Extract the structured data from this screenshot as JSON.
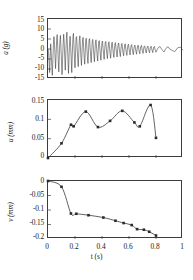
{
  "figure": {
    "name": "seismic-response-three-panel",
    "background": "#ffffff",
    "line_color": "#333333",
    "marker_color": "#2b2b2b",
    "axis_color": "#3c3c3c"
  },
  "chart_data": [
    {
      "type": "line",
      "panel": "top",
      "name": "acceleration-time-history",
      "title": "",
      "xlabel": "",
      "ylabel": "a (g)",
      "ylabel_symbol": "a",
      "ylabel_unit": "(g)",
      "xlim": [
        0,
        1
      ],
      "ylim": [
        -15,
        15
      ],
      "yticks": [
        15,
        10,
        5,
        0,
        -5,
        -10,
        -15
      ],
      "ytick_labels": [
        "15",
        "10",
        "5",
        "0",
        "-5",
        "-10",
        "-15"
      ],
      "xticks": [
        0,
        0.2,
        0.4,
        0.6,
        0.8,
        1
      ],
      "xtick_labels": [],
      "grid": false,
      "legend": false,
      "x": [
        0.0,
        0.004,
        0.008,
        0.012,
        0.016,
        0.02,
        0.024,
        0.028,
        0.032,
        0.036,
        0.04,
        0.044,
        0.048,
        0.052,
        0.056,
        0.06,
        0.064,
        0.068,
        0.072,
        0.076,
        0.08,
        0.084,
        0.088,
        0.092,
        0.096,
        0.1,
        0.104,
        0.108,
        0.112,
        0.116,
        0.12,
        0.124,
        0.128,
        0.132,
        0.136,
        0.14,
        0.144,
        0.148,
        0.152,
        0.156,
        0.16,
        0.164,
        0.168,
        0.172,
        0.176,
        0.18,
        0.184,
        0.188,
        0.192,
        0.196,
        0.2,
        0.204,
        0.208,
        0.212,
        0.216,
        0.22,
        0.224,
        0.228,
        0.232,
        0.236,
        0.24,
        0.244,
        0.248,
        0.252,
        0.256,
        0.26,
        0.264,
        0.268,
        0.272,
        0.276,
        0.28,
        0.284,
        0.288,
        0.292,
        0.296,
        0.3,
        0.304,
        0.308,
        0.312,
        0.316,
        0.32,
        0.324,
        0.328,
        0.332,
        0.336,
        0.34,
        0.344,
        0.348,
        0.352,
        0.356,
        0.36,
        0.364,
        0.368,
        0.372,
        0.376,
        0.38,
        0.384,
        0.388,
        0.392,
        0.396,
        0.4,
        0.404,
        0.408,
        0.412,
        0.416,
        0.42,
        0.424,
        0.428,
        0.432,
        0.436,
        0.44,
        0.444,
        0.448,
        0.452,
        0.456,
        0.46,
        0.464,
        0.468,
        0.472,
        0.476,
        0.48,
        0.484,
        0.488,
        0.492,
        0.496,
        0.5,
        0.504,
        0.508,
        0.512,
        0.516,
        0.52,
        0.524,
        0.528,
        0.532,
        0.536,
        0.54,
        0.544,
        0.548,
        0.552,
        0.556,
        0.56,
        0.564,
        0.568,
        0.572,
        0.576,
        0.58,
        0.584,
        0.588,
        0.592,
        0.596,
        0.6,
        0.604,
        0.608,
        0.612,
        0.616,
        0.62,
        0.624,
        0.628,
        0.632,
        0.636,
        0.64,
        0.644,
        0.648,
        0.652,
        0.656,
        0.66,
        0.664,
        0.668,
        0.672,
        0.676,
        0.68,
        0.684,
        0.688,
        0.692,
        0.696,
        0.7,
        0.704,
        0.708,
        0.712,
        0.716,
        0.72,
        0.724,
        0.728,
        0.732,
        0.736,
        0.74,
        0.744,
        0.748,
        0.752,
        0.756,
        0.76,
        0.764,
        0.768,
        0.772,
        0.776,
        0.78,
        0.784,
        0.788,
        0.792,
        0.796,
        0.8,
        0.81,
        0.82,
        0.83,
        0.84,
        0.85,
        0.86,
        0.87,
        0.88,
        0.89,
        0.9,
        0.92,
        0.94,
        0.96,
        0.98,
        1.0
      ],
      "values": [
        0.0,
        -1.8,
        -6.4,
        -11.8,
        -4.2,
        2.6,
        -2.2,
        -8.6,
        -13.2,
        -5.4,
        1.8,
        6.2,
        2.4,
        -3.6,
        -9.8,
        -2.8,
        4.4,
        7.2,
        1.2,
        -5.8,
        -11.4,
        -3.2,
        3.8,
        6.8,
        0.4,
        -6.2,
        -12.8,
        -4.8,
        2.2,
        7.4,
        3.2,
        -4.2,
        -10.6,
        -2.4,
        5.2,
        8.4,
        1.6,
        -5.4,
        -12.2,
        -3.8,
        3.4,
        6.4,
        0.8,
        -5.2,
        -11.8,
        -2.6,
        4.8,
        7.8,
        2.2,
        -4.6,
        -9.4,
        -1.8,
        5.6,
        6.2,
        0.6,
        -4.8,
        -8.8,
        -2.2,
        4.2,
        6.6,
        1.4,
        -4.4,
        -8.2,
        -1.6,
        4.6,
        5.8,
        0.8,
        -4.2,
        -7.6,
        -1.4,
        4.8,
        5.4,
        0.4,
        -3.8,
        -7.2,
        -1.2,
        4.4,
        5.2,
        0.6,
        -3.6,
        -6.8,
        -1.0,
        4.2,
        4.8,
        0.4,
        -3.4,
        -6.4,
        -0.8,
        3.8,
        4.6,
        0.2,
        -3.2,
        -6.0,
        -0.6,
        3.6,
        4.2,
        0.4,
        -3.0,
        -5.6,
        -0.6,
        3.4,
        4.0,
        0.2,
        -2.8,
        -5.2,
        -0.4,
        3.2,
        3.8,
        0.2,
        -2.6,
        -4.8,
        -0.4,
        3.0,
        3.6,
        0.2,
        -2.4,
        -4.6,
        -0.4,
        2.8,
        3.4,
        0.2,
        -2.2,
        -4.2,
        -0.2,
        2.6,
        3.2,
        0.2,
        -2.2,
        -4.0,
        -0.2,
        2.4,
        3.0,
        0.1,
        -2.0,
        -3.8,
        -0.2,
        2.2,
        2.8,
        0.1,
        -1.8,
        -3.4,
        -0.2,
        2.0,
        2.6,
        0.1,
        -1.8,
        -3.2,
        -0.2,
        1.9,
        2.4,
        0.1,
        -1.6,
        -3.0,
        -0.1,
        1.8,
        2.2,
        0.1,
        -1.5,
        -2.8,
        -0.1,
        1.6,
        2.0,
        0.1,
        -1.4,
        -2.6,
        -0.1,
        1.5,
        1.9,
        0.1,
        -1.3,
        -2.4,
        -0.1,
        1.4,
        1.8,
        0.1,
        -1.2,
        -2.2,
        -0.1,
        1.3,
        1.6,
        0.1,
        -1.1,
        -2.0,
        -0.1,
        1.2,
        1.5,
        0.1,
        -1.0,
        -1.9,
        -0.1,
        1.1,
        1.4,
        0.1,
        -0.9,
        -1.8,
        -0.1,
        1.0,
        1.3,
        0.1,
        -0.9,
        -1.6,
        -0.1,
        0.9,
        1.2,
        0.1,
        -0.8,
        -1.5,
        -0.1,
        0.8,
        1.1,
        0.05,
        -0.7,
        -1.3,
        0.6,
        0.9,
        -0.6,
        -1.1,
        0.5,
        0.8,
        -0.5,
        -0.9,
        0.4,
        0.6,
        -0.4,
        -0.7,
        0.3,
        0.4,
        0.2,
        0.1,
        0.05,
        0.0
      ]
    },
    {
      "type": "line",
      "panel": "middle",
      "name": "displacement-time-history",
      "title": "",
      "xlabel": "",
      "ylabel": "u (mm)",
      "ylabel_symbol": "u",
      "ylabel_unit": "(mm)",
      "xlim": [
        0,
        1
      ],
      "ylim": [
        0,
        0.15
      ],
      "yticks": [
        0.15,
        0.1,
        0.05,
        0
      ],
      "ytick_labels": [
        "0.15",
        "0.1",
        "0.05",
        "0"
      ],
      "xticks": [
        0,
        0.2,
        0.4,
        0.6,
        0.8,
        1
      ],
      "xtick_labels": [],
      "grid": false,
      "legend": false,
      "marker": "square",
      "x": [
        0.0,
        0.1,
        0.17,
        0.19,
        0.28,
        0.37,
        0.46,
        0.55,
        0.64,
        0.68,
        0.76,
        0.8
      ],
      "values": [
        0.0,
        0.038,
        0.086,
        0.082,
        0.12,
        0.08,
        0.096,
        0.122,
        0.092,
        0.082,
        0.137,
        0.052
      ]
    },
    {
      "type": "line",
      "panel": "bottom",
      "name": "settlement-time-history",
      "title": "",
      "xlabel": "t (s)",
      "xlabel_symbol": "t",
      "xlabel_unit": "(s)",
      "ylabel": "v (mm)",
      "ylabel_symbol": "v",
      "ylabel_unit": "(mm)",
      "xlim": [
        0,
        1
      ],
      "ylim": [
        -0.2,
        0
      ],
      "yticks": [
        0,
        -0.05,
        -0.1,
        -0.15,
        -0.2
      ],
      "ytick_labels": [
        "0",
        "-0.05",
        "-0.1",
        "-0.15",
        "-0.2"
      ],
      "xticks": [
        0,
        0.2,
        0.4,
        0.6,
        0.8,
        1
      ],
      "xtick_labels": [
        "0",
        "0.2",
        "0.4",
        "0.6",
        "0.8",
        "1"
      ],
      "grid": false,
      "legend": false,
      "marker": "square",
      "x": [
        0.0,
        0.1,
        0.17,
        0.21,
        0.3,
        0.41,
        0.5,
        0.56,
        0.62,
        0.66,
        0.71,
        0.75,
        0.8
      ],
      "values": [
        0.0,
        -0.02,
        -0.112,
        -0.113,
        -0.118,
        -0.126,
        -0.137,
        -0.145,
        -0.152,
        -0.166,
        -0.168,
        -0.175,
        -0.188
      ]
    }
  ]
}
